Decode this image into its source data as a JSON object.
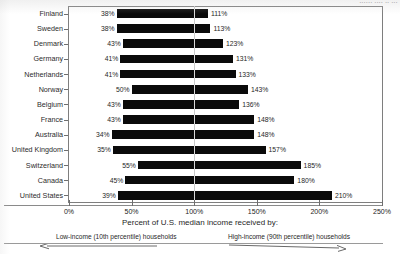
{
  "header": {
    "cut_off_text": "······ ···· ·· ···"
  },
  "chart_data": {
    "type": "bar",
    "orientation": "horizontal",
    "subtype": "range-bar",
    "title": "",
    "xlabel": "Percent of U.S. median income received by:",
    "ylabel": "",
    "xlim": [
      0,
      250
    ],
    "xticks": [
      0,
      50,
      100,
      150,
      200,
      250
    ],
    "xtick_labels": [
      "0%",
      "50%",
      "100%",
      "150%",
      "200%",
      "250%"
    ],
    "grid": true,
    "gridline_at": 100,
    "categories": [
      "Finland",
      "Sweden",
      "Denmark",
      "Germany",
      "Netherlands",
      "Norway",
      "Belgium",
      "France",
      "Australia",
      "United Kingdom",
      "Switzerland",
      "Canada",
      "United States"
    ],
    "series": [
      {
        "name": "Low-income (10th percentile) households",
        "values": [
          38,
          38,
          43,
          41,
          41,
          50,
          43,
          43,
          34,
          35,
          55,
          45,
          39
        ],
        "labels": [
          "38%",
          "38%",
          "43%",
          "41%",
          "41%",
          "50%",
          "43%",
          "43%",
          "34%",
          "35%",
          "55%",
          "45%",
          "39%"
        ]
      },
      {
        "name": "High-income (90th percentile) households",
        "values": [
          111,
          113,
          123,
          131,
          133,
          143,
          136,
          148,
          148,
          157,
          185,
          180,
          210
        ],
        "labels": [
          "111%",
          "113%",
          "123%",
          "131%",
          "133%",
          "143%",
          "136%",
          "148%",
          "148%",
          "157%",
          "185%",
          "180%",
          "210%"
        ]
      }
    ],
    "legend": {
      "position": "bottom",
      "entries": [
        {
          "label": "Low-income (10th percentile) households",
          "arrow": "left"
        },
        {
          "label": "High-income (90th percentile) households",
          "arrow": "right"
        }
      ]
    },
    "colors": {
      "bar": "#0a0a0a",
      "gridline": "#c8c8c8",
      "axis": "#7e7e7e",
      "background": "#ffffff",
      "text": "#1f1f1f"
    }
  }
}
